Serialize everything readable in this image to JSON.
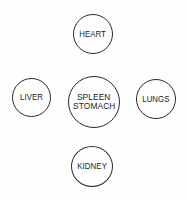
{
  "diagram": {
    "background_color": "#fefefe",
    "outline_color": "#2b2b2b",
    "text_color": "#222222",
    "nodes": [
      {
        "id": "heart",
        "lines": [
          "HEART"
        ]
      },
      {
        "id": "liver",
        "lines": [
          "LIVER"
        ]
      },
      {
        "id": "spleen-stomach",
        "lines": [
          "SPLEEN",
          "STOMACH"
        ]
      },
      {
        "id": "lungs",
        "lines": [
          "LUNGS"
        ]
      },
      {
        "id": "kidney",
        "lines": [
          "KIDNEY"
        ]
      }
    ]
  }
}
